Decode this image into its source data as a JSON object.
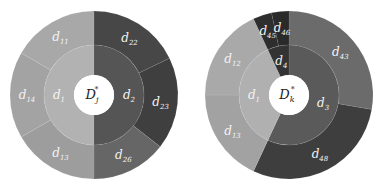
{
  "chart_data": [
    {
      "type": "sunburst",
      "title": "",
      "center_label": {
        "main": "D",
        "sub": "j",
        "sup": "*"
      },
      "center": [
        94,
        95
      ],
      "radii": {
        "hole": 20,
        "inner": 50,
        "outer": 84
      },
      "inner_ring": [
        {
          "label": "d",
          "sub": "1",
          "start": 180,
          "end": 360,
          "color": "#b2b2b2"
        },
        {
          "label": "d",
          "sub": "2",
          "start": 0,
          "end": 180,
          "color": "#555555"
        }
      ],
      "outer_ring": [
        {
          "label": "d",
          "sub": "22",
          "start": 0,
          "end": 64,
          "color": "#474747",
          "parent": "d2"
        },
        {
          "label": "d",
          "sub": "23",
          "start": 64,
          "end": 128,
          "color": "#3f3f3f",
          "parent": "d2"
        },
        {
          "label": "d",
          "sub": "26",
          "start": 128,
          "end": 180,
          "color": "#666666",
          "parent": "d2"
        },
        {
          "label": "d",
          "sub": "13",
          "start": 180,
          "end": 240,
          "color": "#9d9d9d",
          "parent": "d1"
        },
        {
          "label": "d",
          "sub": "14",
          "start": 240,
          "end": 300,
          "color": "#a3a3a3",
          "parent": "d1"
        },
        {
          "label": "d",
          "sub": "11",
          "start": 300,
          "end": 360,
          "color": "#a8a8a8",
          "parent": "d1"
        }
      ]
    },
    {
      "type": "sunburst",
      "title": "",
      "center_label": {
        "main": "D",
        "sub": "k",
        "sup": "*"
      },
      "center": [
        289,
        95
      ],
      "radii": {
        "hole": 20,
        "inner": 50,
        "outer": 84
      },
      "inner_ring": [
        {
          "label": "d",
          "sub": "3",
          "start": 0,
          "end": 205,
          "color": "#5a5a5a"
        },
        {
          "label": "d",
          "sub": "1",
          "start": 205,
          "end": 335,
          "color": "#b0b0b0"
        },
        {
          "label": "d",
          "sub": "4",
          "start": 335,
          "end": 360,
          "color": "#333333"
        }
      ],
      "outer_ring": [
        {
          "label": "d",
          "sub": "43",
          "start": 0,
          "end": 100,
          "color": "#6b6b6b",
          "parent": "d3"
        },
        {
          "label": "d",
          "sub": "48",
          "start": 100,
          "end": 205,
          "color": "#3e3e3e",
          "parent": "d3"
        },
        {
          "label": "d",
          "sub": "13",
          "start": 205,
          "end": 270,
          "color": "#a2a2a2",
          "parent": "d1"
        },
        {
          "label": "d",
          "sub": "12",
          "start": 270,
          "end": 335,
          "color": "#a9a9a9",
          "parent": "d1"
        },
        {
          "label": "d",
          "sub": "45",
          "start": 335,
          "end": 348,
          "color": "#2e2e2e",
          "parent": "d4"
        },
        {
          "label": "d",
          "sub": "46",
          "start": 348,
          "end": 360,
          "color": "#2a2a2a",
          "parent": "d4"
        }
      ]
    }
  ]
}
